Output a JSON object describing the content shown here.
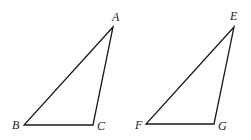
{
  "diagram": {
    "triangles": [
      {
        "name": "ABC",
        "vertices": [
          {
            "label": "A",
            "x": 113,
            "y": 27,
            "lx": 112,
            "ly": 21
          },
          {
            "label": "B",
            "x": 24,
            "y": 125,
            "lx": 12,
            "ly": 129
          },
          {
            "label": "C",
            "x": 93,
            "y": 125,
            "lx": 97,
            "ly": 130
          }
        ]
      },
      {
        "name": "EFG",
        "vertices": [
          {
            "label": "E",
            "x": 234,
            "y": 27,
            "lx": 230,
            "ly": 20
          },
          {
            "label": "F",
            "x": 146,
            "y": 124,
            "lx": 135,
            "ly": 129
          },
          {
            "label": "G",
            "x": 214,
            "y": 124,
            "lx": 218,
            "ly": 130
          }
        ]
      }
    ],
    "colors": {
      "stroke": "#1a1a1a",
      "background": "#ffffff"
    }
  }
}
